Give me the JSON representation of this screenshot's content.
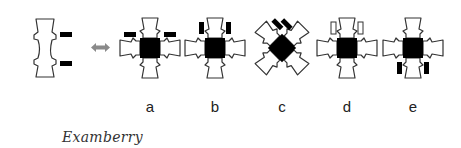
{
  "diagram": {
    "single_piece": {
      "name": "single-piece",
      "bars": 2,
      "bar_side": "right"
    },
    "arrow": {
      "name": "double-arrow",
      "color": "#8a8a8a"
    },
    "options": [
      {
        "label": "a",
        "bars": "horizontal bars above left and right arms",
        "center_x": 150
      },
      {
        "label": "b",
        "bars": "vertical bars on top beside upper arm",
        "center_x": 215
      },
      {
        "label": "c",
        "bars": "diagonal bars on upper-left (rotated 45°)",
        "center_x": 282
      },
      {
        "label": "d",
        "bars": "outlined vertical bars on top beside upper arm",
        "center_x": 347
      },
      {
        "label": "e",
        "bars": "vertical bars below beside lower arm",
        "center_x": 413
      }
    ],
    "colors": {
      "outline": "#333333",
      "fill": "#ffffff",
      "block": "#000000",
      "arrow": "#8a8a8a"
    }
  },
  "watermark": "Examberry"
}
